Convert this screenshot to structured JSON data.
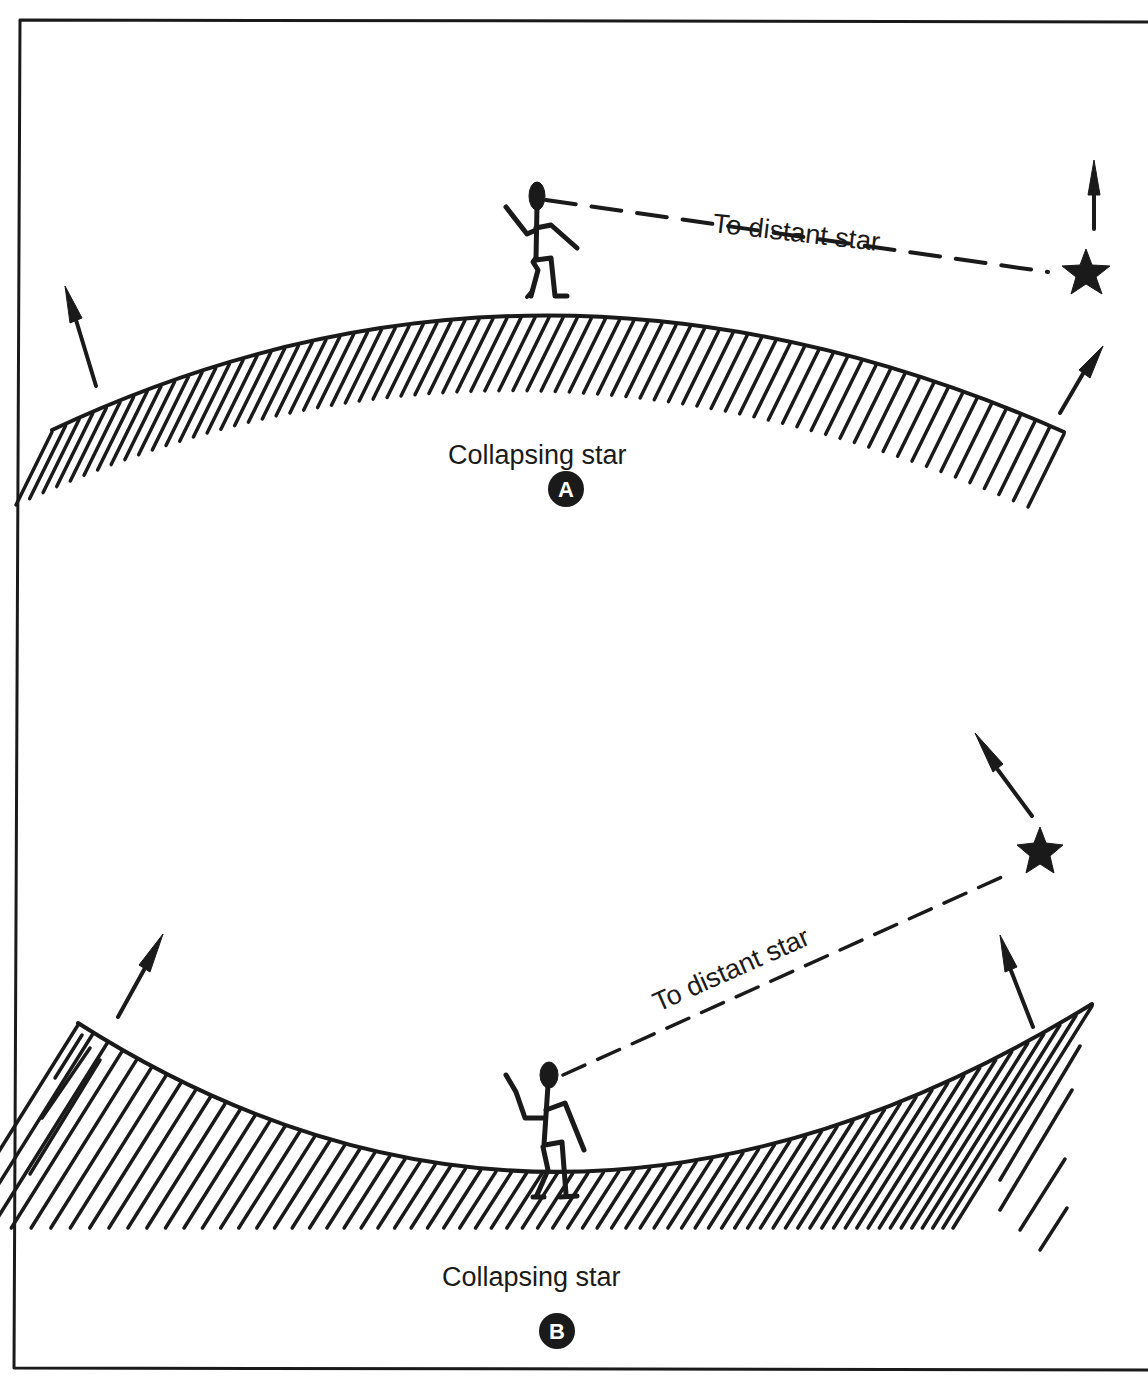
{
  "figure": {
    "colors": {
      "ink": "#1a1a1a",
      "background": "#ffffff"
    },
    "panels": [
      {
        "id": "A",
        "badge": "A",
        "surface_label": "Collapsing star",
        "line_label": "To distant star",
        "surface_shape": "convex",
        "icons": [
          "stick-figure-observer",
          "distant-star-icon",
          "outward-arrow-left",
          "outward-arrow-right",
          "star-motion-arrow"
        ]
      },
      {
        "id": "B",
        "badge": "B",
        "surface_label": "Collapsing star",
        "line_label": "To distant star",
        "surface_shape": "concave",
        "icons": [
          "stick-figure-observer",
          "distant-star-icon",
          "outward-arrow-left",
          "outward-arrow-right",
          "star-motion-arrow"
        ]
      }
    ]
  }
}
